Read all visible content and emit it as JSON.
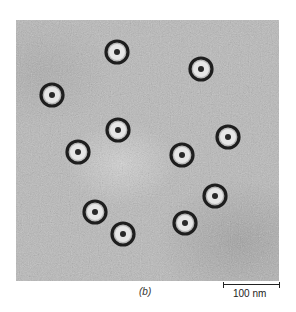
{
  "figure": {
    "panel_label": "(b)",
    "scale_bar": {
      "label": "100 nm",
      "length_px": 55
    },
    "background_color": "#b9b9b9",
    "particle_ring_color": "#1e1e1e",
    "particle_halo_color": "#e6e6e6",
    "particles": [
      {
        "x": 117,
        "y": 52
      },
      {
        "x": 201,
        "y": 69
      },
      {
        "x": 52,
        "y": 95
      },
      {
        "x": 118,
        "y": 130
      },
      {
        "x": 228,
        "y": 137
      },
      {
        "x": 78,
        "y": 152
      },
      {
        "x": 182,
        "y": 155
      },
      {
        "x": 215,
        "y": 196
      },
      {
        "x": 95,
        "y": 212
      },
      {
        "x": 185,
        "y": 223
      },
      {
        "x": 123,
        "y": 234
      }
    ]
  }
}
